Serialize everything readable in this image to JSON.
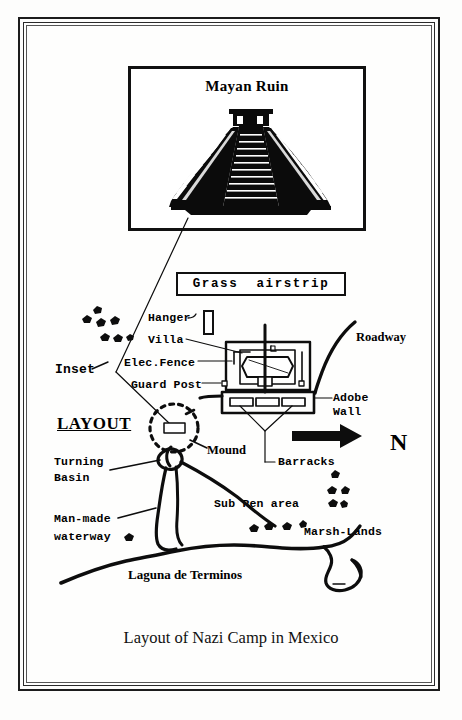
{
  "document": {
    "caption": "Layout of Nazi Camp in Mexico",
    "frame_color": "#1c1c1c",
    "ink_color": "#000000",
    "paper_color": "#fdfdfc"
  },
  "inset": {
    "title": "Mayan Ruin",
    "figure": "step-pyramid"
  },
  "airstrip": {
    "label": "Grass  airstrip"
  },
  "labels": {
    "hanger": "Hanger",
    "villa": "Villa",
    "elec_fence": "Elec.Fence",
    "guard_post": "Guard Post",
    "inset": "Inset",
    "layout": "LAYOUT",
    "roadway": "Roadway",
    "adobe_wall_line1": "Adobe",
    "adobe_wall_line2": "Wall",
    "mound": "Mound",
    "barracks": "Barracks",
    "turning_basin_line1": "Turning",
    "turning_basin_line2": "Basin",
    "man_made_line1": "Man-made",
    "man_made_line2": "waterway",
    "sub_pen": "Sub Pen area",
    "marsh_lands": "Marsh-Lands",
    "laguna": "Laguna de Terminos",
    "compass_north": "N"
  }
}
